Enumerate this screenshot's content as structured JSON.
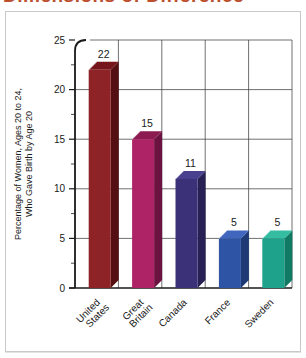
{
  "page": {
    "clipped_title": "Dimensions of Difference",
    "title_color": "#bb4f2e"
  },
  "chart_data": {
    "type": "bar",
    "title": "Dimensions of Difference",
    "title_note": "title clipped at top edge of image",
    "categories": [
      "United States",
      "Great Britain",
      "Canada",
      "France",
      "Sweden"
    ],
    "values": [
      22,
      15,
      11,
      5,
      5
    ],
    "value_labels": [
      "22",
      "15",
      "11",
      "5",
      "5"
    ],
    "ylabel_line1": "Percentage of Women, Ages 20 to 24,",
    "ylabel_line2": "Who Gave Birth by Age 20",
    "ylim": [
      0,
      25
    ],
    "yticks": [
      0,
      5,
      10,
      15,
      20,
      25
    ],
    "minor_tick_interval": 2.5,
    "grid": "full grid, thin dark lines, vertical column separators",
    "style": "3d-bars",
    "bar_colors": [
      {
        "front": "#8d2327",
        "top": "#74161b",
        "side": "#540f12"
      },
      {
        "front": "#ad2366",
        "top": "#8c1b51",
        "side": "#6c1240"
      },
      {
        "front": "#3b3178",
        "top": "#4a418e",
        "side": "#262055"
      },
      {
        "front": "#2e54a6",
        "top": "#4066bd",
        "side": "#1d3a75"
      },
      {
        "front": "#1fa28b",
        "top": "#35bda2",
        "side": "#117a64"
      }
    ],
    "axis_color": "#1a1a1a",
    "grid_color": "#404040",
    "label_color": "#1a1a1a"
  }
}
